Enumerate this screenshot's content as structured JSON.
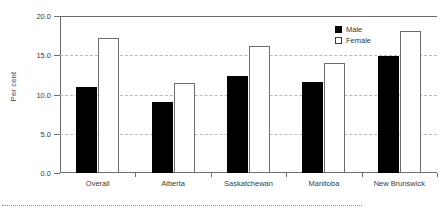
{
  "chart_data": {
    "type": "bar",
    "title": "",
    "subtitle": "",
    "xlabel": "",
    "ylabel": "Per cent",
    "categories": [
      "Overall",
      "Alberta",
      "Saskatchewan",
      "Manitoba",
      "New Brunswick"
    ],
    "series": [
      {
        "name": "Male",
        "values": [
          11.0,
          9.1,
          12.4,
          11.6,
          14.9
        ],
        "color": "#000000",
        "fill": "solid"
      },
      {
        "name": "Female",
        "values": [
          17.2,
          11.5,
          16.2,
          14.0,
          18.1
        ],
        "color": "#ffffff",
        "fill": "outline"
      }
    ],
    "ylim": [
      0.0,
      20.0
    ],
    "yticks": [
      0.0,
      5.0,
      10.0,
      15.0,
      20.0
    ],
    "ytick_labels": [
      "0.0",
      "5.0",
      "10.0",
      "15.0",
      "20.0"
    ],
    "grid": true,
    "grid_axis": "y",
    "grid_style": "dashed",
    "legend": [
      "Male",
      "Female"
    ],
    "legend_position": "top-right"
  },
  "axis": {
    "y_title": "Per cent"
  },
  "legend": {
    "items": [
      {
        "label": "Male"
      },
      {
        "label": "Female"
      }
    ]
  }
}
